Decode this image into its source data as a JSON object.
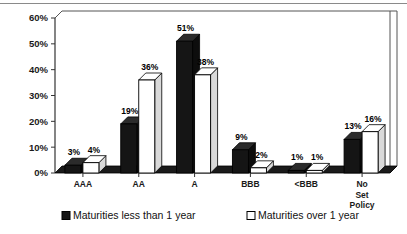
{
  "chart_data": {
    "type": "bar",
    "title": "",
    "subtitle": "",
    "xlabel": "",
    "ylabel": "",
    "ylim": [
      0,
      60
    ],
    "ytick_values": [
      0,
      10,
      20,
      30,
      40,
      50,
      60
    ],
    "ytick_labels": [
      "0%",
      "10%",
      "20%",
      "30%",
      "40%",
      "50%",
      "60%"
    ],
    "grid": false,
    "legend_position": "bottom",
    "style": "3d-column",
    "categories": [
      "AAA",
      "AA",
      "A",
      "BBB",
      "<BBB",
      "No Set Policy"
    ],
    "category_label_lines": [
      [
        "AAA"
      ],
      [
        "AA"
      ],
      [
        "A"
      ],
      [
        "BBB"
      ],
      [
        "<BBB"
      ],
      [
        "No",
        "Set",
        "Policy"
      ]
    ],
    "series": [
      {
        "name": "Maturities less than 1 year",
        "color": "#151515",
        "marker": "filled-square",
        "values": [
          3,
          19,
          51,
          9,
          1,
          13
        ],
        "data_labels": [
          "3%",
          "19%",
          "51%",
          "9%",
          "1%",
          "13%"
        ]
      },
      {
        "name": "Maturities over 1 year",
        "color": "#ffffff",
        "marker": "hollow-square",
        "values": [
          4,
          36,
          38,
          2,
          1,
          16
        ],
        "data_labels": [
          "4%",
          "36%",
          "38%",
          "2%",
          "1%",
          "16%"
        ]
      }
    ]
  },
  "colors": {
    "series_one": "#151515",
    "series_two": "#ffffff",
    "outline": "#000000",
    "floor": "#1a1a1a",
    "plot_border": "#555555",
    "background": "#ffffff",
    "top_rule": "#8a8a8a"
  },
  "legend": {
    "items": [
      {
        "label": "Maturities less than 1 year",
        "swatch": "filled-square"
      },
      {
        "label": "Maturities over 1 year",
        "swatch": "hollow-square"
      }
    ]
  }
}
